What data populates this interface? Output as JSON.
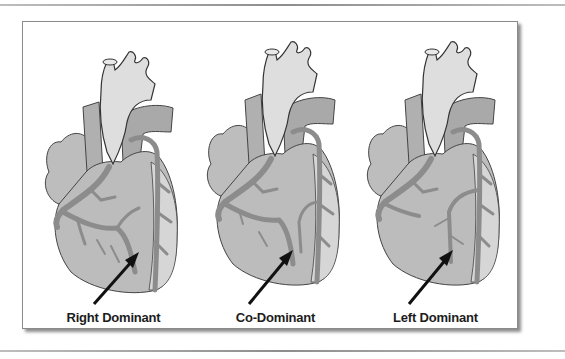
{
  "figure": {
    "panels": [
      {
        "id": "right",
        "label": "Right Dominant",
        "arrow_target": "posterior-descending-from-right"
      },
      {
        "id": "co",
        "label": "Co-Dominant",
        "arrow_target": "posterior-descending-shared"
      },
      {
        "id": "left",
        "label": "Left Dominant",
        "arrow_target": "posterior-descending-from-left"
      }
    ]
  },
  "colors": {
    "heart_fill": "#b9b9b9",
    "aorta_fill": "#dcdcdc",
    "vessel": "#8a8a8a",
    "outline": "#333333",
    "arrow": "#111111",
    "label": "#1c1c1c"
  }
}
